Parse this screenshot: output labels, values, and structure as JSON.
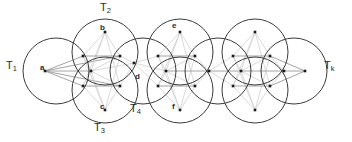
{
  "figure": {
    "width": 352,
    "height": 142,
    "background_color": "#ffffff",
    "circle_stroke_color": "#3a3a3a",
    "edge_color": "#cfcfcf",
    "edge_color_dark": "#8d8d8d",
    "vertex_color": "#1a1a1a"
  },
  "disk_labels": [
    {
      "id": "T1",
      "base": "T",
      "sub": "1",
      "x": 6,
      "y": 60
    },
    {
      "id": "T2",
      "base": "T",
      "sub": "2",
      "x": 100,
      "y": 2
    },
    {
      "id": "T3",
      "base": "T",
      "sub": "3",
      "x": 94,
      "y": 122
    },
    {
      "id": "T4",
      "base": "T",
      "sub": "4",
      "x": 130,
      "y": 103
    },
    {
      "id": "Tk",
      "base": "T",
      "sub": "k",
      "x": 324,
      "y": 60
    }
  ],
  "vertex_labels": [
    {
      "id": "a",
      "text": "a",
      "x": 40,
      "y": 64
    },
    {
      "id": "b",
      "text": "b",
      "x": 100,
      "y": 24
    },
    {
      "id": "c",
      "text": "c",
      "x": 100,
      "y": 103
    },
    {
      "id": "d",
      "text": "d",
      "x": 135,
      "y": 73
    },
    {
      "id": "e",
      "text": "e",
      "x": 172,
      "y": 22
    },
    {
      "id": "f",
      "text": "f",
      "x": 172,
      "y": 103
    }
  ],
  "circles": [
    {
      "id": "T1",
      "cx": 56,
      "cy": 71,
      "r": 33
    },
    {
      "id": "T2",
      "cx": 105,
      "cy": 52,
      "r": 33
    },
    {
      "id": "T3",
      "cx": 105,
      "cy": 90,
      "r": 33
    },
    {
      "id": "c4",
      "cx": 143,
      "cy": 71,
      "r": 33
    },
    {
      "id": "T4",
      "cx": 180,
      "cy": 52,
      "r": 33
    },
    {
      "id": "c6",
      "cx": 180,
      "cy": 90,
      "r": 33
    },
    {
      "id": "c7",
      "cx": 218,
      "cy": 71,
      "r": 33
    },
    {
      "id": "c8",
      "cx": 255,
      "cy": 52,
      "r": 33
    },
    {
      "id": "c9",
      "cx": 255,
      "cy": 90,
      "r": 33
    },
    {
      "id": "Tk",
      "cx": 294,
      "cy": 71,
      "r": 33
    }
  ],
  "vertices": [
    {
      "id": "a",
      "x": 45,
      "y": 71
    },
    {
      "id": "v1",
      "x": 83,
      "y": 56
    },
    {
      "id": "v2",
      "x": 83,
      "y": 86
    },
    {
      "id": "b",
      "x": 105,
      "y": 32
    },
    {
      "id": "v3",
      "x": 91,
      "y": 71
    },
    {
      "id": "v4",
      "x": 120,
      "y": 56
    },
    {
      "id": "v5",
      "x": 120,
      "y": 86
    },
    {
      "id": "c",
      "x": 105,
      "y": 110
    },
    {
      "id": "d",
      "x": 134,
      "y": 63
    },
    {
      "id": "v6",
      "x": 158,
      "y": 56
    },
    {
      "id": "v7",
      "x": 158,
      "y": 86
    },
    {
      "id": "e",
      "x": 180,
      "y": 32
    },
    {
      "id": "v8",
      "x": 166,
      "y": 71
    },
    {
      "id": "v9",
      "x": 195,
      "y": 56
    },
    {
      "id": "v10",
      "x": 195,
      "y": 86
    },
    {
      "id": "f",
      "x": 180,
      "y": 110
    },
    {
      "id": "v11",
      "x": 209,
      "y": 71
    },
    {
      "id": "v12",
      "x": 233,
      "y": 56
    },
    {
      "id": "v13",
      "x": 233,
      "y": 86
    },
    {
      "id": "v14",
      "x": 255,
      "y": 32
    },
    {
      "id": "v15",
      "x": 241,
      "y": 71
    },
    {
      "id": "v16",
      "x": 270,
      "y": 56
    },
    {
      "id": "v17",
      "x": 270,
      "y": 86
    },
    {
      "id": "v18",
      "x": 255,
      "y": 110
    },
    {
      "id": "v19",
      "x": 284,
      "y": 71
    },
    {
      "id": "k",
      "x": 305,
      "y": 71
    }
  ],
  "edges": [
    [
      "a",
      "v1"
    ],
    [
      "a",
      "v2"
    ],
    [
      "a",
      "v3"
    ],
    [
      "a",
      "v4"
    ],
    [
      "a",
      "v5"
    ],
    [
      "b",
      "v1"
    ],
    [
      "b",
      "v3"
    ],
    [
      "b",
      "v4"
    ],
    [
      "b",
      "v5"
    ],
    [
      "b",
      "v2"
    ],
    [
      "c",
      "v1"
    ],
    [
      "c",
      "v2"
    ],
    [
      "c",
      "v3"
    ],
    [
      "c",
      "v4"
    ],
    [
      "c",
      "v5"
    ],
    [
      "v1",
      "v3"
    ],
    [
      "v2",
      "v3"
    ],
    [
      "v3",
      "v4"
    ],
    [
      "v3",
      "v5"
    ],
    [
      "v1",
      "v4"
    ],
    [
      "v2",
      "v5"
    ],
    [
      "v4",
      "d"
    ],
    [
      "v5",
      "d"
    ],
    [
      "v3",
      "d"
    ],
    [
      "d",
      "v6"
    ],
    [
      "d",
      "v7"
    ],
    [
      "d",
      "v8"
    ],
    [
      "e",
      "v6"
    ],
    [
      "e",
      "v8"
    ],
    [
      "e",
      "v9"
    ],
    [
      "e",
      "v10"
    ],
    [
      "e",
      "v7"
    ],
    [
      "f",
      "v6"
    ],
    [
      "f",
      "v7"
    ],
    [
      "f",
      "v8"
    ],
    [
      "f",
      "v9"
    ],
    [
      "f",
      "v10"
    ],
    [
      "v6",
      "v8"
    ],
    [
      "v7",
      "v8"
    ],
    [
      "v8",
      "v9"
    ],
    [
      "v8",
      "v10"
    ],
    [
      "v6",
      "v9"
    ],
    [
      "v7",
      "v10"
    ],
    [
      "v9",
      "v11"
    ],
    [
      "v10",
      "v11"
    ],
    [
      "v8",
      "v11"
    ],
    [
      "v11",
      "v12"
    ],
    [
      "v11",
      "v13"
    ],
    [
      "v11",
      "v15"
    ],
    [
      "v14",
      "v12"
    ],
    [
      "v14",
      "v15"
    ],
    [
      "v14",
      "v16"
    ],
    [
      "v14",
      "v17"
    ],
    [
      "v14",
      "v13"
    ],
    [
      "v18",
      "v12"
    ],
    [
      "v18",
      "v13"
    ],
    [
      "v18",
      "v15"
    ],
    [
      "v18",
      "v16"
    ],
    [
      "v18",
      "v17"
    ],
    [
      "v12",
      "v15"
    ],
    [
      "v13",
      "v15"
    ],
    [
      "v15",
      "v16"
    ],
    [
      "v15",
      "v17"
    ],
    [
      "v12",
      "v16"
    ],
    [
      "v13",
      "v17"
    ],
    [
      "v16",
      "v19"
    ],
    [
      "v17",
      "v19"
    ],
    [
      "v15",
      "v19"
    ],
    [
      "v19",
      "k"
    ],
    [
      "v16",
      "k"
    ],
    [
      "v17",
      "k"
    ]
  ]
}
